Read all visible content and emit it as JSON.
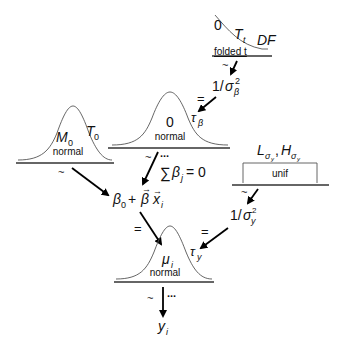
{
  "diagram": {
    "folded_t": {
      "dist_label": "folded t",
      "params": {
        "location": "0",
        "scale": "T",
        "scale_sub": "t",
        "df": "DF"
      },
      "relation": "~"
    },
    "inv_sigma_beta": {
      "num": "1/",
      "sym": "σ",
      "sub": "β",
      "sup": "2"
    },
    "tau_beta": {
      "sym": "τ",
      "sub": "β",
      "relation": "="
    },
    "beta_prior": {
      "dist_label": "normal",
      "mean": "0",
      "relation": "~",
      "ellipsis": "...",
      "constraint": {
        "sum": "∑",
        "beta": "β",
        "sub": "j",
        "eq": "= 0"
      }
    },
    "beta0_prior": {
      "dist_label": "normal",
      "mean": "M",
      "mean_sub": "0",
      "sd": "T",
      "sd_sub": "0",
      "relation": "~"
    },
    "sigma_y_prior": {
      "dist_label": "unif",
      "low": "L",
      "high": "H",
      "sub": "σ",
      "subsub": "y",
      "sep": ",",
      "relation": "~"
    },
    "inv_sigma_y": {
      "num": "1/",
      "sym": "σ",
      "sub": "y",
      "sup": "2"
    },
    "tau_y": {
      "sym": "τ",
      "sub": "y",
      "relation": "="
    },
    "linear_predictor": {
      "b0": "β",
      "b0_sub": "0",
      "plus": "+",
      "beta": "β",
      "x": "x",
      "x_sub": "i",
      "relation": "="
    },
    "likelihood": {
      "dist_label": "normal",
      "mean": "μ",
      "mean_sub": "i",
      "relation": "~",
      "ellipsis": "..."
    },
    "outcome": {
      "sym": "y",
      "sub": "i"
    }
  }
}
